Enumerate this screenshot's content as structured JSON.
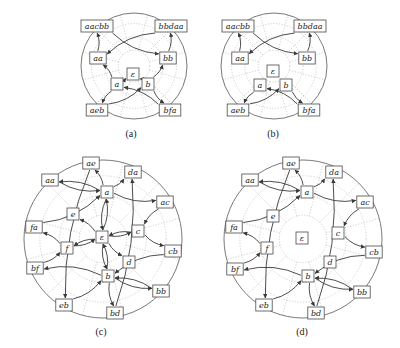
{
  "figure": {
    "panels": [
      {
        "id": "a",
        "caption": "(a)",
        "caption_pos": [
          131,
          133
        ],
        "center": [
          134,
          66
        ],
        "radius": 53,
        "nodes": [
          {
            "id": "aacbb",
            "label": "aacbb",
            "x": 97,
            "y": 26
          },
          {
            "id": "bbdaa",
            "label": "bbdaa",
            "x": 171,
            "y": 26
          },
          {
            "id": "aa",
            "label": "aa",
            "x": 98,
            "y": 58
          },
          {
            "id": "bb",
            "label": "bb",
            "x": 168,
            "y": 58
          },
          {
            "id": "eps",
            "label": "ε",
            "x": 133,
            "y": 74
          },
          {
            "id": "a",
            "label": "a",
            "x": 117,
            "y": 84
          },
          {
            "id": "b",
            "label": "b",
            "x": 148,
            "y": 84
          },
          {
            "id": "aeb",
            "label": "aeb",
            "x": 97,
            "y": 110
          },
          {
            "id": "bfa",
            "label": "bfa",
            "x": 170,
            "y": 110
          }
        ],
        "edges": [
          [
            "aa",
            "aacbb"
          ],
          [
            "bb",
            "bbdaa"
          ],
          [
            "aacbb",
            "bb"
          ],
          [
            "bbdaa",
            "aa"
          ],
          [
            "a",
            "aa"
          ],
          [
            "b",
            "bb"
          ],
          [
            "a",
            "eps"
          ],
          [
            "b",
            "eps"
          ],
          [
            "aeb",
            "b"
          ],
          [
            "bfa",
            "a"
          ],
          [
            "a",
            "aeb"
          ],
          [
            "b",
            "bfa"
          ]
        ]
      },
      {
        "id": "b",
        "caption": "(b)",
        "caption_pos": [
          273,
          133
        ],
        "center": [
          274,
          66
        ],
        "radius": 53,
        "nodes": [
          {
            "id": "aacbb",
            "label": "aacbb",
            "x": 238,
            "y": 26
          },
          {
            "id": "bbdaa",
            "label": "bbdaa",
            "x": 310,
            "y": 26
          },
          {
            "id": "aa",
            "label": "aa",
            "x": 240,
            "y": 58
          },
          {
            "id": "bb",
            "label": "bb",
            "x": 307,
            "y": 58
          },
          {
            "id": "eps",
            "label": "ε",
            "x": 273,
            "y": 71
          },
          {
            "id": "a",
            "label": "a",
            "x": 260,
            "y": 85
          },
          {
            "id": "b",
            "label": "b",
            "x": 286,
            "y": 85
          },
          {
            "id": "aeb",
            "label": "aeb",
            "x": 238,
            "y": 110
          },
          {
            "id": "bfa",
            "label": "bfa",
            "x": 309,
            "y": 110
          }
        ],
        "edges": [
          [
            "aa",
            "aacbb"
          ],
          [
            "bb",
            "bbdaa"
          ],
          [
            "aacbb",
            "bb"
          ],
          [
            "bbdaa",
            "aa"
          ],
          [
            "a",
            "aeb"
          ],
          [
            "b",
            "bfa"
          ],
          [
            "aeb",
            "b"
          ],
          [
            "bfa",
            "a"
          ]
        ]
      },
      {
        "id": "c",
        "caption": "(c)",
        "caption_pos": [
          101,
          331
        ],
        "center": [
          103,
          239
        ],
        "radius": 79,
        "nodes": [
          {
            "id": "ae",
            "label": "ae",
            "x": 91,
            "y": 163
          },
          {
            "id": "da",
            "label": "da",
            "x": 133,
            "y": 172
          },
          {
            "id": "aa",
            "label": "aa",
            "x": 50,
            "y": 180
          },
          {
            "id": "a",
            "label": "a",
            "x": 107,
            "y": 192
          },
          {
            "id": "ac",
            "label": "ac",
            "x": 165,
            "y": 202
          },
          {
            "id": "e",
            "label": "e",
            "x": 73,
            "y": 214
          },
          {
            "id": "fa",
            "label": "fa",
            "x": 34,
            "y": 227
          },
          {
            "id": "eps",
            "label": "ε",
            "x": 102,
            "y": 237
          },
          {
            "id": "c",
            "label": "c",
            "x": 138,
            "y": 231
          },
          {
            "id": "f",
            "label": "f",
            "x": 67,
            "y": 248
          },
          {
            "id": "cb",
            "label": "cb",
            "x": 173,
            "y": 251
          },
          {
            "id": "d",
            "label": "d",
            "x": 129,
            "y": 262
          },
          {
            "id": "bf",
            "label": "bf",
            "x": 35,
            "y": 268
          },
          {
            "id": "b",
            "label": "b",
            "x": 108,
            "y": 276
          },
          {
            "id": "bb",
            "label": "bb",
            "x": 161,
            "y": 291
          },
          {
            "id": "eb",
            "label": "eb",
            "x": 64,
            "y": 305
          },
          {
            "id": "bd",
            "label": "bd",
            "x": 115,
            "y": 313
          }
        ],
        "edges": [
          [
            "a",
            "ae"
          ],
          [
            "a",
            "da"
          ],
          [
            "aa",
            "a"
          ],
          [
            "a",
            "aa"
          ],
          [
            "a",
            "ac"
          ],
          [
            "fa",
            "a"
          ],
          [
            "ac",
            "c"
          ],
          [
            "c",
            "cb"
          ],
          [
            "cb",
            "b"
          ],
          [
            "b",
            "bb"
          ],
          [
            "bb",
            "b"
          ],
          [
            "b",
            "bf"
          ],
          [
            "b",
            "bd"
          ],
          [
            "eb",
            "b"
          ],
          [
            "bf",
            "f"
          ],
          [
            "f",
            "fa"
          ],
          [
            "ae",
            "eb"
          ],
          [
            "bd",
            "da"
          ],
          [
            "eps",
            "a"
          ],
          [
            "a",
            "eps"
          ],
          [
            "eps",
            "b"
          ],
          [
            "b",
            "eps"
          ],
          [
            "eps",
            "e"
          ],
          [
            "eps",
            "f"
          ],
          [
            "f",
            "eps"
          ],
          [
            "eps",
            "c"
          ],
          [
            "c",
            "eps"
          ],
          [
            "eps",
            "d"
          ]
        ]
      },
      {
        "id": "d",
        "caption": "(d)",
        "caption_pos": [
          302,
          331
        ],
        "center": [
          303,
          239
        ],
        "radius": 79,
        "nodes": [
          {
            "id": "ae",
            "label": "ae",
            "x": 291,
            "y": 163
          },
          {
            "id": "da",
            "label": "da",
            "x": 334,
            "y": 172
          },
          {
            "id": "aa",
            "label": "aa",
            "x": 250,
            "y": 180
          },
          {
            "id": "a",
            "label": "a",
            "x": 307,
            "y": 192
          },
          {
            "id": "ac",
            "label": "ac",
            "x": 365,
            "y": 202
          },
          {
            "id": "e",
            "label": "e",
            "x": 273,
            "y": 216
          },
          {
            "id": "fa",
            "label": "fa",
            "x": 234,
            "y": 227
          },
          {
            "id": "eps",
            "label": "ε",
            "x": 302,
            "y": 238
          },
          {
            "id": "c",
            "label": "c",
            "x": 338,
            "y": 233
          },
          {
            "id": "f",
            "label": "f",
            "x": 267,
            "y": 248
          },
          {
            "id": "cb",
            "label": "cb",
            "x": 374,
            "y": 252
          },
          {
            "id": "d",
            "label": "d",
            "x": 330,
            "y": 262
          },
          {
            "id": "bf",
            "label": "bf",
            "x": 235,
            "y": 269
          },
          {
            "id": "b",
            "label": "b",
            "x": 308,
            "y": 276
          },
          {
            "id": "bb",
            "label": "bb",
            "x": 362,
            "y": 292
          },
          {
            "id": "eb",
            "label": "eb",
            "x": 264,
            "y": 305
          },
          {
            "id": "bd",
            "label": "bd",
            "x": 316,
            "y": 313
          }
        ],
        "edges": [
          [
            "a",
            "ae"
          ],
          [
            "a",
            "da"
          ],
          [
            "aa",
            "a"
          ],
          [
            "a",
            "aa"
          ],
          [
            "a",
            "ac"
          ],
          [
            "fa",
            "a"
          ],
          [
            "ac",
            "c"
          ],
          [
            "c",
            "cb"
          ],
          [
            "cb",
            "b"
          ],
          [
            "b",
            "bb"
          ],
          [
            "bb",
            "b"
          ],
          [
            "b",
            "bf"
          ],
          [
            "b",
            "bd"
          ],
          [
            "eb",
            "b"
          ],
          [
            "bf",
            "f"
          ],
          [
            "f",
            "fa"
          ],
          [
            "ae",
            "eb"
          ],
          [
            "bd",
            "da"
          ]
        ]
      }
    ]
  }
}
